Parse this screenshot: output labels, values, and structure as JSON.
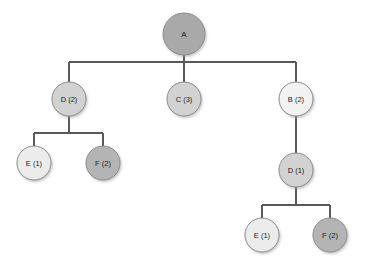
{
  "diagram": {
    "type": "tree",
    "title": "",
    "background_color": "#ffffff",
    "edge_color": "#595959",
    "node_stroke_color": "#8c8c8c",
    "label_color": "#1a1a1a",
    "nodes": [
      {
        "id": "root",
        "label": "A",
        "cx": 184,
        "cy": 34,
        "r": 21,
        "fill": "#a9a9a9",
        "level": 0
      },
      {
        "id": "n-d2-left",
        "label": "D (2)",
        "cx": 69,
        "cy": 99,
        "r": 17,
        "fill": "#d2d2d2",
        "level": 1
      },
      {
        "id": "n-c3",
        "label": "C (3)",
        "cx": 184,
        "cy": 99,
        "r": 17,
        "fill": "#d2d2d2",
        "level": 1
      },
      {
        "id": "n-b2",
        "label": "B (2)",
        "cx": 296,
        "cy": 99,
        "r": 17,
        "fill": "#f2f2f2",
        "level": 1
      },
      {
        "id": "n-e1-left",
        "label": "E (1)",
        "cx": 34,
        "cy": 163,
        "r": 17,
        "fill": "#ececec",
        "level": 2
      },
      {
        "id": "n-f2-left",
        "label": "F (2)",
        "cx": 103,
        "cy": 163,
        "r": 17,
        "fill": "#b4b4b4",
        "level": 2
      },
      {
        "id": "n-d1-right",
        "label": "D (1)",
        "cx": 296,
        "cy": 170,
        "r": 17,
        "fill": "#d2d2d2",
        "level": 2
      },
      {
        "id": "n-e1-right",
        "label": "E (1)",
        "cx": 262,
        "cy": 235,
        "r": 17,
        "fill": "#ececec",
        "level": 3
      },
      {
        "id": "n-f2-right",
        "label": "F (2)",
        "cx": 330,
        "cy": 235,
        "r": 17,
        "fill": "#b4b4b4",
        "level": 3
      }
    ],
    "edges": [
      {
        "id": "edge-root-bus",
        "from": "root",
        "to": "level1-bus"
      },
      {
        "id": "edge-bus-d2",
        "from": "level1-bus",
        "to": "n-d2-left"
      },
      {
        "id": "edge-bus-c3",
        "from": "level1-bus",
        "to": "n-c3"
      },
      {
        "id": "edge-bus-b2",
        "from": "level1-bus",
        "to": "n-b2"
      },
      {
        "id": "edge-d2-bus",
        "from": "n-d2-left",
        "to": "left-bus"
      },
      {
        "id": "edge-leftbus-e1",
        "from": "left-bus",
        "to": "n-e1-left"
      },
      {
        "id": "edge-leftbus-f2",
        "from": "left-bus",
        "to": "n-f2-left"
      },
      {
        "id": "edge-b2-d1",
        "from": "n-b2",
        "to": "n-d1-right"
      },
      {
        "id": "edge-d1-bus",
        "from": "n-d1-right",
        "to": "right-bus"
      },
      {
        "id": "edge-rightbus-e1",
        "from": "right-bus",
        "to": "n-e1-right"
      },
      {
        "id": "edge-rightbus-f2",
        "from": "right-bus",
        "to": "n-f2-right"
      }
    ]
  }
}
